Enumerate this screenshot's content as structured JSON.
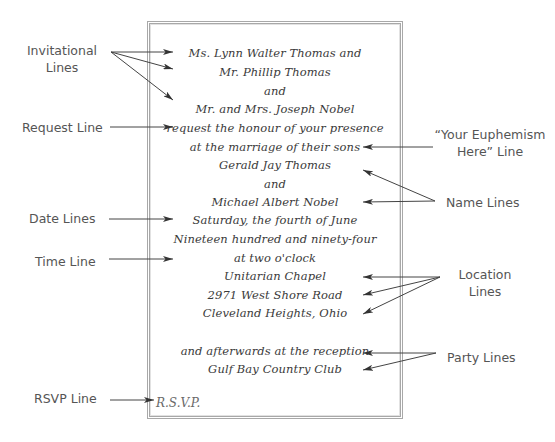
{
  "invitation": {
    "lines": [
      "Ms. Lynn Walter Thomas and",
      "Mr. Phillip Thomas",
      "and",
      "Mr. and Mrs. Joseph Nobel",
      "request the honour of your presence",
      "at the marriage of their sons",
      "Gerald Jay Thomas",
      "and",
      "Michael Albert Nobel",
      "Saturday, the fourth of June",
      "Nineteen hundred and ninety-four",
      "at two o'clock",
      "Unitarian Chapel",
      "2971 West Shore Road",
      "Cleveland Heights, Ohio",
      "and afterwards at the reception",
      "Gulf Bay Country Club"
    ],
    "rsvp": "R.S.V.P."
  },
  "labels": {
    "invitational_1": "Invitational",
    "invitational_2": "Lines",
    "request": "Request Line",
    "date": "Date Lines",
    "time": "Time Line",
    "rsvp": "RSVP Line",
    "euphemism_1": "“Your Euphemism",
    "euphemism_2": "Here” Line",
    "name": "Name Lines",
    "location_1": "Location",
    "location_2": "Lines",
    "party": "Party Lines"
  },
  "colors": {
    "ink": "#3a3a3a",
    "label": "#555555",
    "border": "#a8a8a8",
    "arrow": "#333333"
  }
}
